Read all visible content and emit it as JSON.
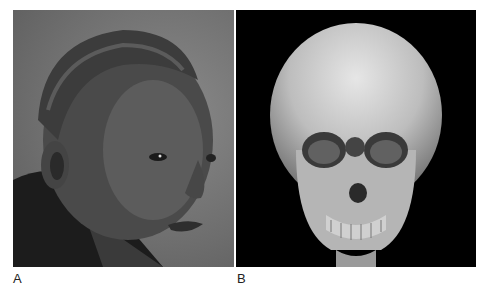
{
  "figure": {
    "panels": [
      {
        "label": "A",
        "content": "photograph-child-profile",
        "background": "#6e6e6e"
      },
      {
        "label": "B",
        "content": "3d-ct-skull-reconstruction",
        "background": "#000000"
      }
    ]
  }
}
